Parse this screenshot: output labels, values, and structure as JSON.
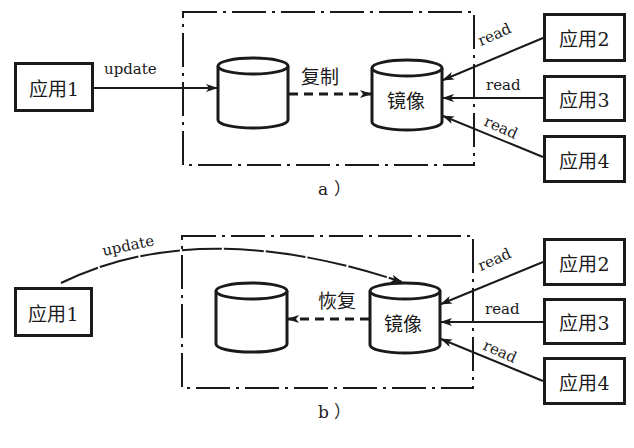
{
  "diagrams": [
    {
      "id": "a",
      "caption": "a ）",
      "source_app": "应用1",
      "source_edge_label": "update",
      "primary_db_label": "",
      "mirror_db_label": "镜像",
      "link_label": "复制",
      "link_direction": "primary-to-mirror",
      "readers": [
        {
          "label": "应用2",
          "edge_label": "read"
        },
        {
          "label": "应用3",
          "edge_label": "read"
        },
        {
          "label": "应用4",
          "edge_label": "read"
        }
      ]
    },
    {
      "id": "b",
      "caption": "b ）",
      "source_app": "应用1",
      "source_edge_label": "update",
      "primary_db_label": "",
      "mirror_db_label": "镜像",
      "link_label": "恢复",
      "link_direction": "mirror-to-primary",
      "readers": [
        {
          "label": "应用2",
          "edge_label": "read"
        },
        {
          "label": "应用3",
          "edge_label": "read"
        },
        {
          "label": "应用4",
          "edge_label": "read"
        }
      ]
    }
  ],
  "colors": {
    "ink": "#1a1a1a",
    "background": "#ffffff"
  }
}
